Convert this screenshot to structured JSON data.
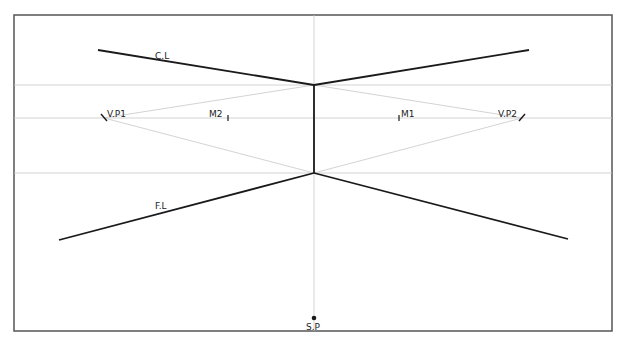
{
  "colors": {
    "frame": "#555555",
    "object_line": "#1a1a1a",
    "guide_line": "#c8c8c8",
    "label": "#222222"
  },
  "labels": {
    "ceiling_line": "C.L",
    "floor_line": "F.L",
    "vanishing_point_1": "V.P1",
    "vanishing_point_2": "V.P2",
    "measuring_point_1": "M1",
    "measuring_point_2": "M2",
    "station_point": "S.P"
  },
  "geometry": {
    "frame": {
      "x1": 14,
      "y1": 15,
      "x2": 612,
      "y2": 331
    },
    "horizon_y": 118,
    "upper_guide_y": 85,
    "lower_guide_y": 173,
    "center_x": 314,
    "vp1": {
      "x": 104,
      "y": 118
    },
    "vp2": {
      "x": 522,
      "y": 118
    },
    "m1_x": 399,
    "m2_x": 228,
    "station_point": {
      "x": 314,
      "y": 318
    }
  }
}
